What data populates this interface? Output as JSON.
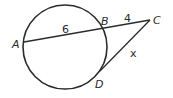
{
  "diagram": {
    "type": "circle-secant-tangent",
    "circle": {
      "cx": 65,
      "cy": 47,
      "r": 42
    },
    "points": {
      "A": {
        "x": 24,
        "y": 42,
        "label": "A"
      },
      "B": {
        "x": 102,
        "y": 29,
        "label": "B"
      },
      "C": {
        "x": 150,
        "y": 20,
        "label": "C"
      },
      "D": {
        "x": 100,
        "y": 71,
        "label": "D"
      }
    },
    "segments": {
      "AB": {
        "label": "6"
      },
      "BC": {
        "label": "4"
      },
      "CD": {
        "label": "x"
      }
    },
    "colors": {
      "stroke": "#2b2b2b",
      "text": "#2a2a2a",
      "background": "#ffffff"
    }
  }
}
